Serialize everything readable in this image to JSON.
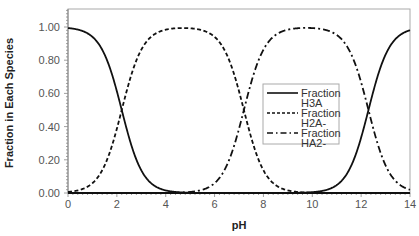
{
  "chart_data": {
    "type": "line",
    "title": "",
    "xlabel": "pH",
    "ylabel": "Fraction in Each Species",
    "xlim": [
      0,
      14
    ],
    "ylim": [
      0,
      1.1
    ],
    "x_ticks": [
      "0",
      "2",
      "4",
      "6",
      "8",
      "10",
      "12",
      "14"
    ],
    "y_ticks": [
      "0.00",
      "0.20",
      "0.40",
      "0.60",
      "0.80",
      "1.00"
    ],
    "grid": false,
    "legend_position": "inside-right-middle",
    "pKa": [
      2.2,
      7.2,
      12.3
    ],
    "x": [
      0,
      1,
      2,
      3,
      4,
      5,
      6,
      7,
      8,
      9,
      10,
      11,
      12,
      13,
      14
    ],
    "series": [
      {
        "name": "Fraction H3A",
        "style": "solid",
        "values": [
          0.994,
          0.94,
          0.613,
          0.137,
          0.016,
          0.002,
          0.0,
          0.0,
          0.0,
          0.0,
          0.0,
          0.0,
          0.0,
          0.0,
          0.0
        ]
      },
      {
        "name": "Fraction H2A-",
        "style": "dashed",
        "values": [
          0.006,
          0.06,
          0.387,
          0.863,
          0.983,
          0.992,
          0.941,
          0.613,
          0.137,
          0.016,
          0.002,
          0.0,
          0.0,
          0.0,
          0.0
        ]
      },
      {
        "name": "Fraction HA2-",
        "style": "dash-dot",
        "values": [
          0.0,
          0.0,
          0.0,
          0.0,
          0.001,
          0.006,
          0.059,
          0.387,
          0.863,
          0.984,
          0.993,
          0.952,
          0.666,
          0.166,
          0.02
        ]
      },
      {
        "name": "A3- (unlabeled)",
        "style": "solid",
        "values": [
          0.0,
          0.0,
          0.0,
          0.0,
          0.0,
          0.0,
          0.0,
          0.0,
          0.0,
          0.0,
          0.005,
          0.048,
          0.334,
          0.834,
          0.98
        ]
      }
    ]
  },
  "legend": {
    "entries": [
      {
        "line1": "Fraction",
        "line2": "H3A",
        "style": "solid"
      },
      {
        "line1": "Fraction",
        "line2": "H2A-",
        "style": "dashed"
      },
      {
        "line1": "Fraction",
        "line2": "HA2-",
        "style": "dash-dot"
      }
    ]
  },
  "colors": {
    "line": "#111111",
    "axis": "#888888",
    "frame": "#aaaaaa"
  }
}
